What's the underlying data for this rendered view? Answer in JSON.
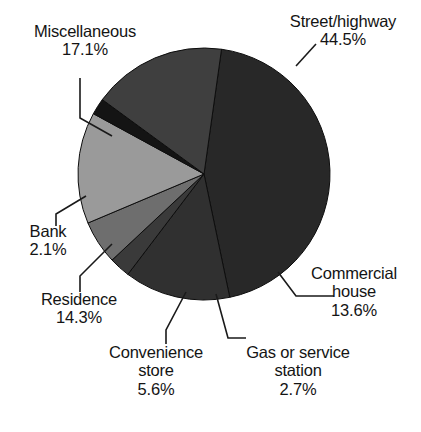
{
  "chart_data": {
    "type": "pie",
    "title": "",
    "subtitle": "",
    "xlabel": "",
    "ylabel": "",
    "legend": "none",
    "grid": false,
    "units": "percent",
    "total": 99.9,
    "categories": [
      "Street/highway",
      "Commercial house",
      "Gas or service station",
      "Convenience store",
      "Residence",
      "Bank",
      "Miscellaneous"
    ],
    "values": [
      44.5,
      13.6,
      2.7,
      5.6,
      14.3,
      2.1,
      17.1
    ],
    "slices": [
      {
        "label": "Street/highway",
        "value": 44.5,
        "value_text": "44.5%",
        "color": "#282828",
        "start_angle": 8,
        "end_angle": 168.2
      },
      {
        "label": "Commercial house",
        "value": 13.6,
        "value_text": "13.6%",
        "color": "#303030",
        "start_angle": 168.2,
        "end_angle": 217.2
      },
      {
        "label": "Gas or service station",
        "value": 2.7,
        "value_text": "2.7%",
        "color": "#3a3a3a",
        "start_angle": 217.2,
        "end_angle": 226.9
      },
      {
        "label": "Convenience store",
        "value": 5.6,
        "value_text": "5.6%",
        "color": "#6e6e6e",
        "start_angle": 226.9,
        "end_angle": 247.1
      },
      {
        "label": "Residence",
        "value": 14.3,
        "value_text": "14.3%",
        "color": "#9a9a9a",
        "start_angle": 247.1,
        "end_angle": 298.6
      },
      {
        "label": "Bank",
        "value": 2.1,
        "value_text": "2.1%",
        "color": "#141414",
        "start_angle": 298.6,
        "end_angle": 306.2
      },
      {
        "label": "Miscellaneous",
        "value": 17.1,
        "value_text": "17.1%",
        "color": "#3f3f3f",
        "start_angle": 306.2,
        "end_angle": 368
      }
    ],
    "geometry": {
      "cx": 204,
      "cy": 174,
      "r": 126
    }
  },
  "labels": {
    "street": {
      "name": "Street/highway",
      "pct": "44.5%"
    },
    "miscellaneous": {
      "name": "Miscellaneous",
      "pct": "17.1%"
    },
    "bank": {
      "name": "Bank",
      "pct": "2.1%"
    },
    "residence": {
      "name": "Residence",
      "pct": "14.3%"
    },
    "convenience": {
      "name": "Convenience",
      "name2": "store",
      "pct": "5.6%"
    },
    "gas": {
      "name": "Gas or service",
      "name2": "station",
      "pct": "2.7%"
    },
    "commercial": {
      "name": "Commercial",
      "name2": "house",
      "pct": "13.6%"
    }
  }
}
